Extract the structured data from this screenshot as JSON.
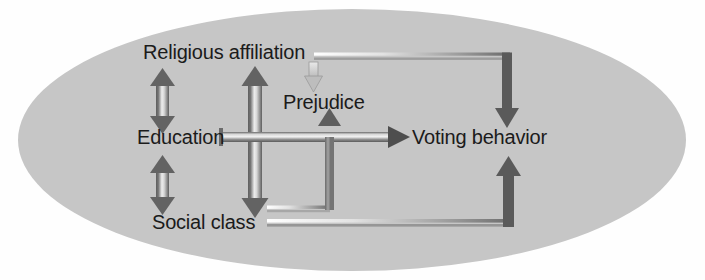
{
  "diagram": {
    "shape": "ellipse",
    "background_color": "#ffffff",
    "ellipse_fill": "#c6c6c6",
    "text_color": "#1b1b1b",
    "arrow_dark_color": "#5a5a5a",
    "arrow_light_color": "#f2f2f2",
    "nodes": [
      {
        "id": "religious-affiliation",
        "label": "Religious affiliation",
        "x": 143,
        "y": 52
      },
      {
        "id": "prejudice",
        "label": "Prejudice",
        "x": 283,
        "y": 100
      },
      {
        "id": "education",
        "label": "Education",
        "x": 137,
        "y": 136
      },
      {
        "id": "voting-behavior",
        "label": "Voting behavior",
        "x": 408,
        "y": 136
      },
      {
        "id": "social-class",
        "label": "Social class",
        "x": 152,
        "y": 221
      }
    ],
    "edges": [
      {
        "id": "religious-education",
        "from": "religious-affiliation",
        "to": "education",
        "style": "double-headed-vertical"
      },
      {
        "id": "education-social",
        "from": "education",
        "to": "social-class",
        "style": "double-headed-vertical"
      },
      {
        "id": "religious-social",
        "from": "religious-affiliation",
        "to": "social-class",
        "style": "double-headed-vertical-tall"
      },
      {
        "id": "religious-prejudice",
        "from": "religious-affiliation",
        "to": "prejudice",
        "style": "short-down-arrow-light"
      },
      {
        "id": "religious-voting",
        "from": "religious-affiliation",
        "to": "voting-behavior",
        "style": "elbow-right-down"
      },
      {
        "id": "education-voting",
        "from": "education",
        "to": "voting-behavior",
        "style": "horizontal-arrow"
      },
      {
        "id": "social-prejudice",
        "from": "social-class",
        "to": "prejudice",
        "style": "elbow-right-up"
      },
      {
        "id": "social-voting",
        "from": "social-class",
        "to": "voting-behavior",
        "style": "elbow-right-up-far"
      }
    ]
  }
}
